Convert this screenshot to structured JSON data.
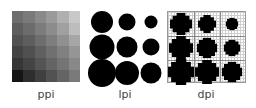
{
  "labels": {
    "ppi": "ppi",
    "lpi": "lpi",
    "dpi": "dpi"
  },
  "ppi": {
    "grid": [
      [
        "#6e6e6e",
        "#7a7a7a",
        "#8a8a8a",
        "#9a9a9a",
        "#b0b0b0",
        "#c8c8c8"
      ],
      [
        "#5e5e5e",
        "#6c6c6c",
        "#7c7c7c",
        "#8c8c8c",
        "#a0a0a0",
        "#bdbdbd"
      ],
      [
        "#525252",
        "#5e5e5e",
        "#6e6e6e",
        "#7e7e7e",
        "#909090",
        "#a6a6a6"
      ],
      [
        "#444444",
        "#505050",
        "#606060",
        "#707070",
        "#808080",
        "#959595"
      ],
      [
        "#363636",
        "#444444",
        "#545454",
        "#646464",
        "#747474",
        "#888888"
      ],
      [
        "#151515",
        "#2e2e2e",
        "#404040",
        "#525252",
        "#646464",
        "#7a7a7a"
      ]
    ]
  },
  "lpi": {
    "dots": [
      {
        "x": 14,
        "y": 13,
        "d": 22
      },
      {
        "x": 39,
        "y": 13,
        "d": 17
      },
      {
        "x": 63,
        "y": 13,
        "d": 13
      },
      {
        "x": 14,
        "y": 38,
        "d": 25
      },
      {
        "x": 39,
        "y": 38,
        "d": 21
      },
      {
        "x": 63,
        "y": 38,
        "d": 17
      },
      {
        "x": 14,
        "y": 64,
        "d": 28
      },
      {
        "x": 39,
        "y": 64,
        "d": 24
      },
      {
        "x": 63,
        "y": 64,
        "d": 21
      }
    ]
  },
  "dpi": {
    "blobs": [
      {
        "x": 13,
        "y": 12,
        "d": 22
      },
      {
        "x": 39,
        "y": 12,
        "d": 18
      },
      {
        "x": 64,
        "y": 12,
        "d": 13
      },
      {
        "x": 13,
        "y": 36,
        "d": 24
      },
      {
        "x": 39,
        "y": 36,
        "d": 21
      },
      {
        "x": 64,
        "y": 36,
        "d": 17
      },
      {
        "x": 13,
        "y": 60,
        "d": 26
      },
      {
        "x": 39,
        "y": 60,
        "d": 24
      },
      {
        "x": 64,
        "y": 60,
        "d": 21
      }
    ]
  }
}
